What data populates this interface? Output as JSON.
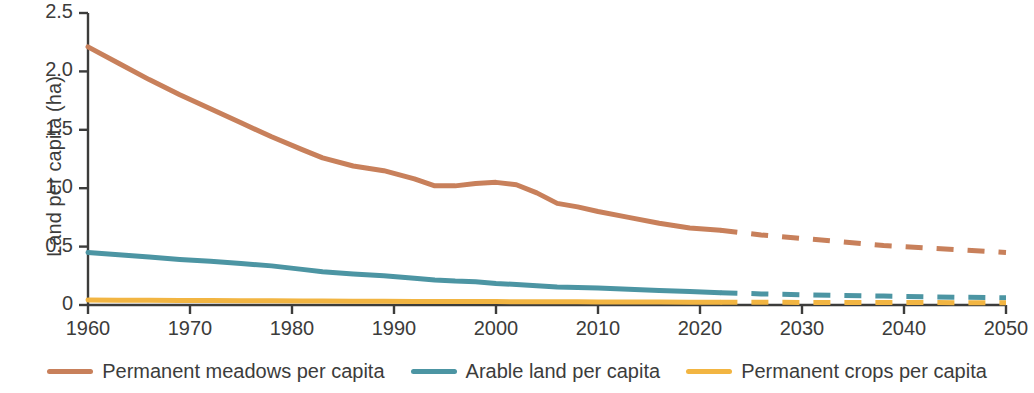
{
  "chart_data": {
    "type": "line",
    "title": "",
    "xlabel": "",
    "ylabel": "Land per capita (ha)",
    "xlim": [
      1960,
      2050
    ],
    "ylim": [
      0,
      2.5
    ],
    "xticks": [
      "1960",
      "1970",
      "1980",
      "1990",
      "2000",
      "2010",
      "2020",
      "2030",
      "2040",
      "2050"
    ],
    "yticks": [
      "2.5",
      "2.0",
      "1.5",
      "1.0",
      "0.5",
      "0"
    ],
    "grid": false,
    "legend_position": "bottom",
    "projection_start_year": 2022,
    "projection_style": "dashed",
    "x": [
      1960,
      1963,
      1966,
      1969,
      1972,
      1975,
      1978,
      1981,
      1983,
      1986,
      1989,
      1992,
      1994,
      1996,
      1998,
      2000,
      2002,
      2004,
      2006,
      2008,
      2010,
      2013,
      2016,
      2019,
      2022,
      2026,
      2030,
      2034,
      2038,
      2042,
      2046,
      2050
    ],
    "series": [
      {
        "name": "Permanent meadows per capita",
        "color": "#C8805B",
        "values": [
          2.21,
          2.07,
          1.93,
          1.8,
          1.68,
          1.56,
          1.44,
          1.33,
          1.26,
          1.19,
          1.15,
          1.08,
          1.02,
          1.02,
          1.04,
          1.05,
          1.03,
          0.96,
          0.87,
          0.84,
          0.8,
          0.75,
          0.7,
          0.66,
          0.64,
          0.6,
          0.57,
          0.54,
          0.51,
          0.49,
          0.47,
          0.45
        ]
      },
      {
        "name": "Arable land per capita",
        "color": "#4C95A3",
        "values": [
          0.45,
          0.43,
          0.41,
          0.39,
          0.375,
          0.355,
          0.335,
          0.305,
          0.285,
          0.265,
          0.25,
          0.23,
          0.215,
          0.205,
          0.2,
          0.185,
          0.175,
          0.165,
          0.155,
          0.15,
          0.145,
          0.135,
          0.125,
          0.115,
          0.105,
          0.095,
          0.088,
          0.082,
          0.076,
          0.071,
          0.066,
          0.062
        ]
      },
      {
        "name": "Permanent crops per capita",
        "color": "#F2B542",
        "values": [
          0.042,
          0.041,
          0.04,
          0.039,
          0.038,
          0.037,
          0.036,
          0.035,
          0.034,
          0.033,
          0.032,
          0.031,
          0.03,
          0.03,
          0.029,
          0.029,
          0.028,
          0.028,
          0.027,
          0.027,
          0.026,
          0.026,
          0.025,
          0.024,
          0.024,
          0.023,
          0.022,
          0.022,
          0.021,
          0.021,
          0.02,
          0.02
        ]
      }
    ]
  },
  "axis": {
    "ylabel": "Land per capita (ha)"
  },
  "legend": {
    "items": [
      {
        "label": "Permanent meadows per capita",
        "color": "#C8805B"
      },
      {
        "label": "Arable land per capita",
        "color": "#4C95A3"
      },
      {
        "label": "Permanent crops per capita",
        "color": "#F2B542"
      }
    ]
  }
}
